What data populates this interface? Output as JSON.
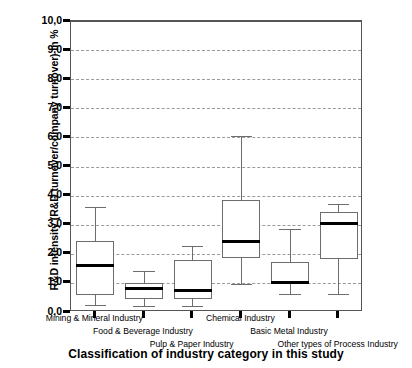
{
  "chart_data": {
    "type": "boxplot",
    "title": "",
    "xlabel": "Classification of industry category in this study",
    "ylabel": "R&D intensity (R&D turnover/company turnover) in %",
    "ylim": [
      0.0,
      10.0
    ],
    "ytick_step": 1.0,
    "ytick_labels": [
      "10,0",
      "9,0",
      "8,0",
      "7,0",
      "6,0",
      "5,0",
      "4,0",
      "3,0",
      "2,0",
      "1,0",
      "0,0"
    ],
    "ytick_values": [
      10.0,
      9.0,
      8.0,
      7.0,
      6.0,
      5.0,
      4.0,
      3.0,
      2.0,
      1.0,
      0.0
    ],
    "grid": true,
    "grid_axis": "y",
    "legend": "none",
    "categories": [
      "Mining & Mineral Industry",
      "Food & Beverage Industry",
      "Pulp & Paper Industry",
      "Chemical Industry",
      "Basic Metal Industry",
      "Other types of Process Industry"
    ],
    "boxes": [
      {
        "category": "Mining & Mineral Industry",
        "whisker_low": 0.25,
        "q1": 0.58,
        "median": 1.6,
        "q3": 2.45,
        "whisker_high": 3.6
      },
      {
        "category": "Food & Beverage Industry",
        "whisker_low": 0.2,
        "q1": 0.45,
        "median": 0.8,
        "q3": 1.0,
        "whisker_high": 1.42
      },
      {
        "category": "Pulp & Paper Industry",
        "whisker_low": 0.2,
        "q1": 0.45,
        "median": 0.75,
        "q3": 1.78,
        "whisker_high": 2.28
      },
      {
        "category": "Chemical Industry",
        "whisker_low": 0.95,
        "q1": 1.85,
        "median": 2.42,
        "q3": 3.85,
        "whisker_high": 6.05
      },
      {
        "category": "Basic Metal Industry",
        "whisker_low": 0.62,
        "q1": 0.95,
        "median": 1.0,
        "q3": 1.72,
        "whisker_high": 2.85
      },
      {
        "category": "Other types of Process Industry",
        "whisker_low": 0.62,
        "q1": 1.82,
        "median": 3.05,
        "q3": 3.45,
        "whisker_high": 3.7
      }
    ],
    "colors": {
      "box_edge": "#6d6d6d",
      "box_fill": "#ffffff",
      "median": "#000000",
      "gridline": "#9a9a9a",
      "frame": "#555555",
      "background": "#ffffff",
      "text": "#000000"
    },
    "label_rows": [
      0,
      1,
      2,
      0,
      1,
      2
    ]
  }
}
